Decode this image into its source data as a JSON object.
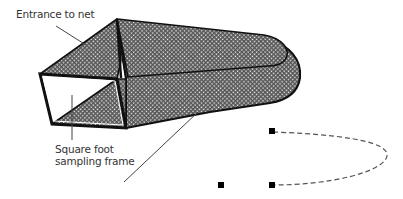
{
  "diagram": {
    "labels": {
      "entrance": "Entrance to net",
      "frame_line1": "Square foot",
      "frame_line2": "sampling frame"
    },
    "colors": {
      "outline": "#111111",
      "mesh_fill": "#8a8a8a",
      "leader_line": "#444444",
      "dashed_curve": "#555555",
      "markers": "#000000"
    },
    "components": [
      "net-body",
      "square-foot-sampling-frame",
      "net-entrance",
      "leader-line-net",
      "control-path-markers"
    ]
  }
}
